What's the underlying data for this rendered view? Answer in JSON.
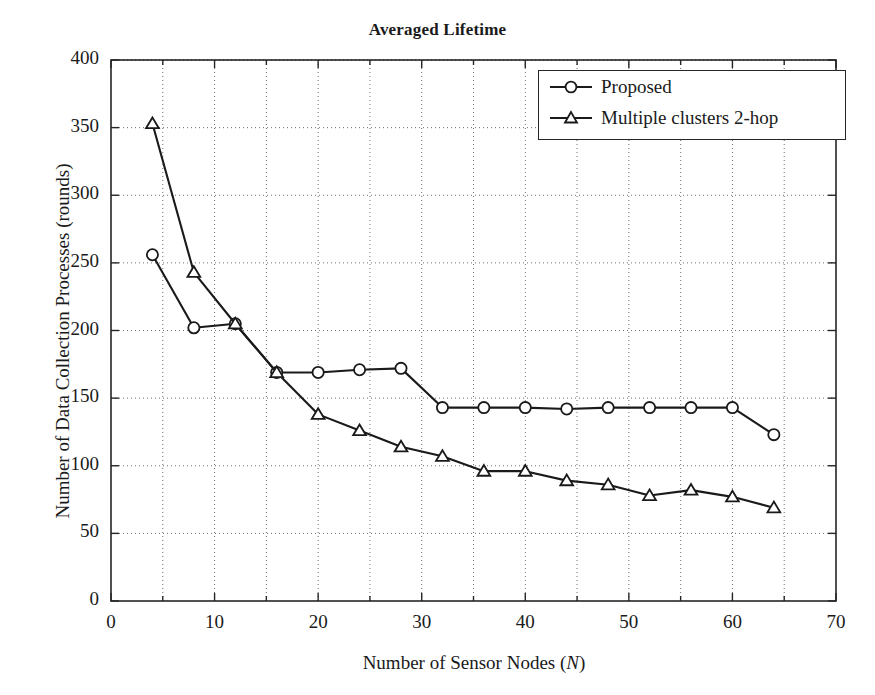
{
  "chart_data": {
    "type": "line",
    "title": "Averaged Lifetime",
    "xlabel": "Number of Sensor Nodes (N)",
    "ylabel": "Number of Data Collection Processes (rounds)",
    "xlim": [
      0,
      70
    ],
    "ylim": [
      0,
      400
    ],
    "xticks": [
      0,
      10,
      20,
      30,
      40,
      50,
      60,
      70
    ],
    "yticks": [
      0,
      50,
      100,
      150,
      200,
      250,
      300,
      350,
      400
    ],
    "x_minor_step": 5,
    "grid": true,
    "grid_style": "dotted",
    "legend_position": "top-right",
    "series": [
      {
        "name": "Proposed",
        "marker": "circle",
        "color": "#1a1a1a",
        "x": [
          4,
          8,
          12,
          16,
          20,
          24,
          28,
          32,
          36,
          40,
          44,
          48,
          52,
          56,
          60,
          64
        ],
        "values": [
          256,
          202,
          205,
          169,
          169,
          171,
          172,
          143,
          143,
          143,
          142,
          143,
          143,
          143,
          143,
          123
        ]
      },
      {
        "name": "Multiple clusters 2-hop",
        "marker": "triangle",
        "color": "#1a1a1a",
        "x": [
          4,
          8,
          12,
          16,
          20,
          24,
          28,
          32,
          36,
          40,
          44,
          48,
          52,
          56,
          60,
          64
        ],
        "values": [
          353,
          243,
          205,
          169,
          138,
          126,
          114,
          107,
          96,
          96,
          89,
          86,
          78,
          82,
          77,
          69
        ]
      }
    ]
  },
  "legend": {
    "items": [
      {
        "label": "Proposed",
        "marker": "circle"
      },
      {
        "label": "Multiple clusters 2-hop",
        "marker": "triangle"
      }
    ]
  }
}
